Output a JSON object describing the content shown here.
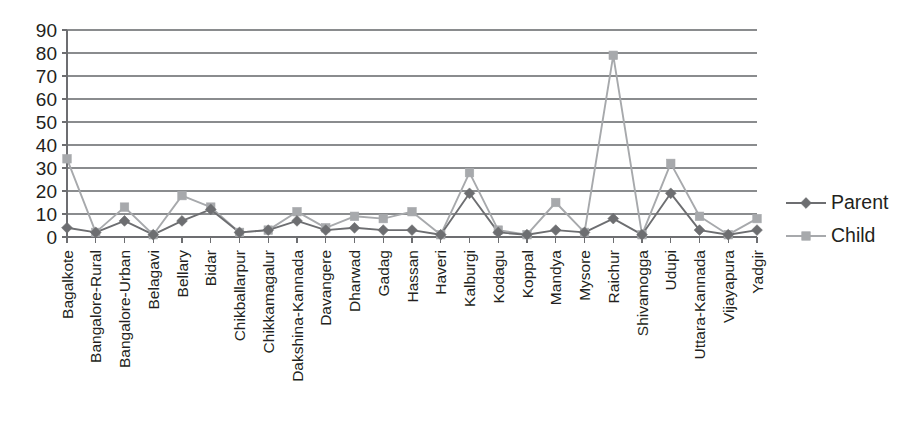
{
  "chart_data": {
    "type": "line",
    "title": "",
    "xlabel": "",
    "ylabel": "",
    "ylim": [
      0,
      90
    ],
    "yticks": [
      0,
      10,
      20,
      30,
      40,
      50,
      60,
      70,
      80,
      90
    ],
    "grid": true,
    "legend_position": "right",
    "categories": [
      "Bagalkote",
      "Bangalore-Rural",
      "Bangalore-Urban",
      "Belagavi",
      "Bellary",
      "Bidar",
      "Chikballarpur",
      "Chikkamagalur",
      "Dakshina-Kannada",
      "Davangere",
      "Dharwad",
      "Gadag",
      "Hassan",
      "Haveri",
      "Kalburgi",
      "Kodagu",
      "Koppal",
      "Mandya",
      "Mysore",
      "Raichur",
      "Shivamogga",
      "Udupi",
      "Uttara-Kannada",
      "Vijayapura",
      "Yadgir"
    ],
    "series": [
      {
        "name": "Parent",
        "color": "#6d6e71",
        "marker": "diamond",
        "values": [
          4,
          2,
          7,
          1,
          7,
          12,
          2,
          3,
          7,
          3,
          4,
          3,
          3,
          1,
          19,
          2,
          1,
          3,
          2,
          8,
          1,
          19,
          3,
          1,
          3
        ]
      },
      {
        "name": "Child",
        "color": "#a7a9ac",
        "marker": "square",
        "values": [
          34,
          2,
          13,
          1,
          18,
          13,
          2,
          3,
          11,
          4,
          9,
          8,
          11,
          1,
          28,
          3,
          1,
          15,
          2,
          79,
          1,
          32,
          9,
          1,
          8
        ]
      }
    ]
  },
  "legend": {
    "items": [
      {
        "label": "Parent"
      },
      {
        "label": "Child"
      }
    ]
  },
  "axis": {
    "y_tick_labels": [
      "90",
      "80",
      "70",
      "60",
      "50",
      "40",
      "30",
      "20",
      "10",
      "0"
    ]
  }
}
